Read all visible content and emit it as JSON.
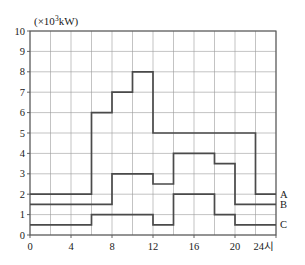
{
  "chart_data": {
    "type": "line",
    "subtype": "step",
    "title": "",
    "xlabel": "24시",
    "ylabel": "(×10³kW)",
    "ylabel_parts": {
      "prefix": "(×10",
      "exponent": "3",
      "suffix": "kW)"
    },
    "xlim": [
      0,
      24
    ],
    "ylim": [
      0,
      10
    ],
    "grid": true,
    "x_major_step": 4,
    "x_grid_step": 2,
    "y_grid_step": 1,
    "legend_position": "right-edge-inline",
    "x_tick_labels": [
      "0",
      "4",
      "8",
      "12",
      "16",
      "20",
      "24시"
    ],
    "x_tick_values": [
      0,
      4,
      8,
      12,
      16,
      20,
      24
    ],
    "y_tick_labels": [
      "0",
      "1",
      "2",
      "3",
      "4",
      "5",
      "6",
      "7",
      "8",
      "9",
      "10"
    ],
    "y_tick_values": [
      0,
      1,
      2,
      3,
      4,
      5,
      6,
      7,
      8,
      9,
      10
    ],
    "series": [
      {
        "name": "A",
        "label": "A",
        "color": "#4a4a4a",
        "steps": [
          {
            "x_start": 0,
            "x_end": 6,
            "value": 2
          },
          {
            "x_start": 6,
            "x_end": 8,
            "value": 6
          },
          {
            "x_start": 8,
            "x_end": 10,
            "value": 7
          },
          {
            "x_start": 10,
            "x_end": 12,
            "value": 8
          },
          {
            "x_start": 12,
            "x_end": 22,
            "value": 5
          },
          {
            "x_start": 22,
            "x_end": 24,
            "value": 2
          }
        ]
      },
      {
        "name": "B",
        "label": "B",
        "color": "#4a4a4a",
        "steps": [
          {
            "x_start": 0,
            "x_end": 8,
            "value": 1.5
          },
          {
            "x_start": 8,
            "x_end": 12,
            "value": 3
          },
          {
            "x_start": 12,
            "x_end": 14,
            "value": 2.5
          },
          {
            "x_start": 14,
            "x_end": 18,
            "value": 4
          },
          {
            "x_start": 18,
            "x_end": 20,
            "value": 3.5
          },
          {
            "x_start": 20,
            "x_end": 24,
            "value": 1.5
          }
        ]
      },
      {
        "name": "C",
        "label": "C",
        "color": "#4a4a4a",
        "steps": [
          {
            "x_start": 0,
            "x_end": 6,
            "value": 0.5
          },
          {
            "x_start": 6,
            "x_end": 12,
            "value": 1
          },
          {
            "x_start": 12,
            "x_end": 14,
            "value": 0.5
          },
          {
            "x_start": 14,
            "x_end": 18,
            "value": 2
          },
          {
            "x_start": 18,
            "x_end": 20,
            "value": 1
          },
          {
            "x_start": 20,
            "x_end": 24,
            "value": 0.5
          }
        ]
      }
    ]
  }
}
